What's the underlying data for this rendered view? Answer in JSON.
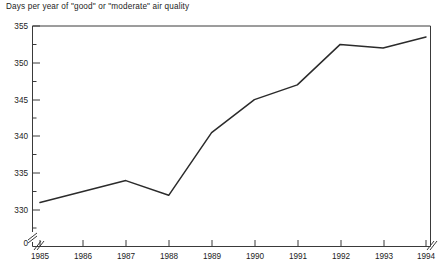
{
  "chart_data": {
    "type": "line",
    "title": "Days per year of \"good\" or \"moderate\" air quality",
    "xlabel": "",
    "ylabel": "",
    "x": [
      1985,
      1986,
      1987,
      1988,
      1989,
      1990,
      1991,
      1992,
      1993,
      1994
    ],
    "categories": [
      "1985",
      "1986",
      "1987",
      "1988",
      "1989",
      "1990",
      "1991",
      "1992",
      "1993",
      "1994"
    ],
    "values": [
      331,
      332.5,
      334,
      332,
      340.5,
      345,
      347,
      352.5,
      352,
      353.5
    ],
    "series": [
      {
        "name": "Days per year of \"good\" or \"moderate\" air quality",
        "values": [
          331,
          332.5,
          334,
          332,
          340.5,
          345,
          347,
          352.5,
          352,
          353.5
        ]
      }
    ],
    "ylim": [
      330,
      355
    ],
    "yticks": [
      330,
      335,
      340,
      345,
      350,
      355
    ],
    "ytick_labels": [
      "330",
      "335",
      "340",
      "345",
      "350",
      "355"
    ],
    "xtick_labels": [
      "1985",
      "1986",
      "1987",
      "1988",
      "1989",
      "1990",
      "1991",
      "1992",
      "1993",
      "1994"
    ],
    "axis_break": true,
    "axis_break_label": "0",
    "grid": false,
    "legend": null,
    "line_color": "#2b2b2b",
    "axis_color": "#3a3a3a"
  },
  "note": ""
}
